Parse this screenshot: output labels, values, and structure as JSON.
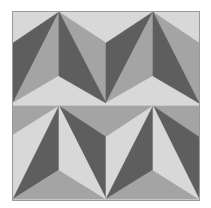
{
  "pattern": {
    "description": "Geometric tessellation of triangles in three gray tones forming zigzag folded-paper shapes",
    "colors": {
      "background": "#ffffff",
      "light": "#d8d8d8",
      "medium": "#a4a4a4",
      "dark": "#5e5e5e",
      "border": "#9a9a9a"
    },
    "frame": {
      "x": 13,
      "y": 12,
      "width": 186,
      "height": 188
    },
    "triangles": [
      {
        "tone": "light",
        "points": "13,12 59,12 13,43"
      },
      {
        "tone": "dark",
        "points": "13,43 59,12 13,103"
      },
      {
        "tone": "medium",
        "points": "59,12 59,76 13,103"
      },
      {
        "tone": "light",
        "points": "13,103 59,76 106,103"
      },
      {
        "tone": "light",
        "points": "59,12 106,12 106,43"
      },
      {
        "tone": "medium",
        "points": "59,12 106,43 106,103"
      },
      {
        "tone": "dark",
        "points": "59,12 59,76 106,103"
      },
      {
        "tone": "light",
        "points": "106,12 153,12 106,43"
      },
      {
        "tone": "dark",
        "points": "106,43 153,12 106,103"
      },
      {
        "tone": "medium",
        "points": "153,12 153,76 106,103"
      },
      {
        "tone": "light",
        "points": "106,103 153,76 199,103"
      },
      {
        "tone": "light",
        "points": "153,12 199,12 199,43"
      },
      {
        "tone": "medium",
        "points": "153,12 199,43 199,103"
      },
      {
        "tone": "dark",
        "points": "153,12 153,76 199,103"
      },
      {
        "tone": "medium",
        "points": "13,106 59,106 13,135"
      },
      {
        "tone": "light",
        "points": "13,135 59,106 13,199"
      },
      {
        "tone": "dark",
        "points": "59,106 59,170 13,199"
      },
      {
        "tone": "medium",
        "points": "13,199 59,170 106,199"
      },
      {
        "tone": "medium",
        "points": "59,106 106,106 106,137"
      },
      {
        "tone": "dark",
        "points": "59,106 106,137 106,199"
      },
      {
        "tone": "light",
        "points": "59,106 59,170 106,199"
      },
      {
        "tone": "medium",
        "points": "106,106 153,106 106,137"
      },
      {
        "tone": "light",
        "points": "106,137 153,106 106,199"
      },
      {
        "tone": "dark",
        "points": "153,106 153,170 106,199"
      },
      {
        "tone": "medium",
        "points": "106,199 153,170 199,199"
      },
      {
        "tone": "medium",
        "points": "153,106 199,106 199,137"
      },
      {
        "tone": "dark",
        "points": "153,106 199,137 199,199"
      },
      {
        "tone": "light",
        "points": "153,106 153,170 199,199"
      }
    ],
    "divider": {
      "y1": 104,
      "y2": 106,
      "tone": "light"
    }
  }
}
